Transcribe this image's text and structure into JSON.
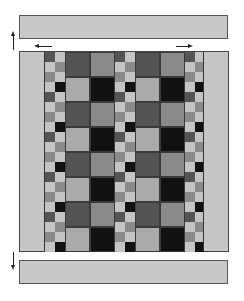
{
  "diagram": {
    "title": "",
    "colors": {
      "bar_fill": "#c9c9c9",
      "border_fill": "#c6c6c6",
      "dark": "#545454",
      "medium": "#8a8a8a",
      "light": "#aaaaaa",
      "pale": "#c4c4c4",
      "black": "#111111"
    },
    "top_bar": {
      "label": ""
    },
    "bottom_bar": {
      "label": ""
    },
    "arrows": [
      {
        "name": "up-arrow-left",
        "direction": "up"
      },
      {
        "name": "left-arrow",
        "direction": "left"
      },
      {
        "name": "right-arrow",
        "direction": "right"
      },
      {
        "name": "down-arrow-left",
        "direction": "down"
      }
    ],
    "sashing_pattern": {
      "period_rows": 4,
      "col_a": [
        "dark",
        "pale",
        "medium",
        "pale"
      ],
      "col_b": [
        "pale",
        "medium",
        "pale",
        "black"
      ]
    },
    "block_pattern": {
      "rows": 8,
      "col_a": [
        "dark",
        "light"
      ],
      "col_b": [
        "medium",
        "black"
      ]
    }
  }
}
